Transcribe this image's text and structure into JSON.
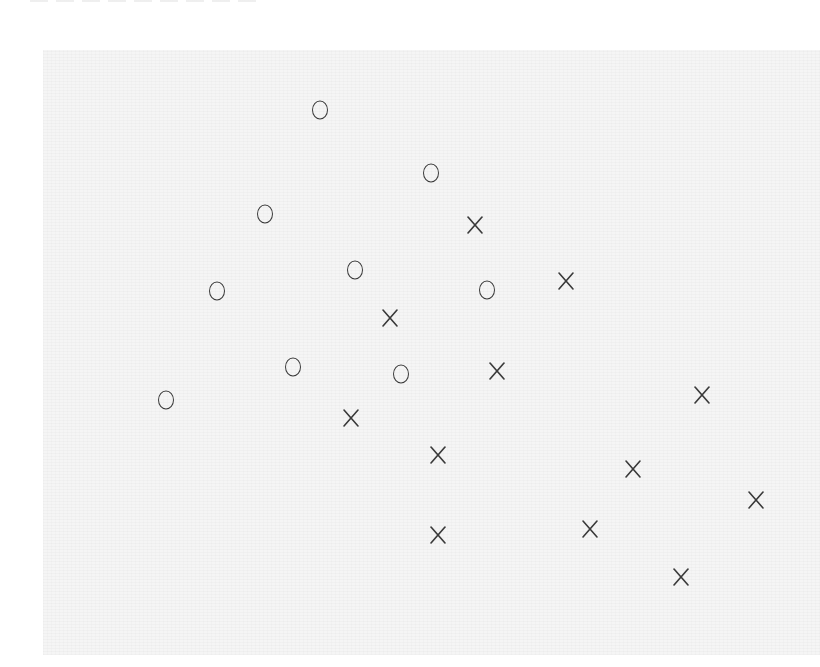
{
  "chart_data": {
    "type": "scatter",
    "title": "",
    "xlabel": "",
    "ylabel": "",
    "grid": false,
    "legend": null,
    "axes_visible": false,
    "coordinate_system": "pixel (image coordinates, y downward)",
    "plot_area": {
      "x": 43,
      "y": 50,
      "width": 777,
      "height": 605
    },
    "series": [
      {
        "name": "O",
        "marker": "circle-glyph",
        "points": [
          {
            "x": 320,
            "y": 110
          },
          {
            "x": 431,
            "y": 173
          },
          {
            "x": 265,
            "y": 214
          },
          {
            "x": 355,
            "y": 270
          },
          {
            "x": 217,
            "y": 291
          },
          {
            "x": 487,
            "y": 290
          },
          {
            "x": 293,
            "y": 367
          },
          {
            "x": 401,
            "y": 374
          },
          {
            "x": 166,
            "y": 400
          }
        ]
      },
      {
        "name": "X",
        "marker": "x-glyph",
        "points": [
          {
            "x": 475,
            "y": 225
          },
          {
            "x": 566,
            "y": 281
          },
          {
            "x": 390,
            "y": 318
          },
          {
            "x": 497,
            "y": 371
          },
          {
            "x": 702,
            "y": 395
          },
          {
            "x": 351,
            "y": 418
          },
          {
            "x": 438,
            "y": 455
          },
          {
            "x": 633,
            "y": 469
          },
          {
            "x": 756,
            "y": 500
          },
          {
            "x": 590,
            "y": 529
          },
          {
            "x": 438,
            "y": 535
          },
          {
            "x": 681,
            "y": 577
          }
        ]
      }
    ]
  },
  "colors": {
    "marker": "#3a3a3a",
    "plot_background": "#f5f5f5",
    "page_background": "#ffffff"
  }
}
